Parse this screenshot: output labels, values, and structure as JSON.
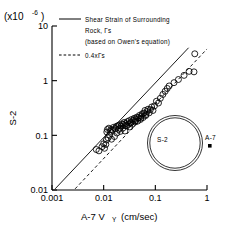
{
  "chart_data": {
    "type": "scatter",
    "title": "",
    "xlabel": "A-7 V",
    "xlabel_sub": "Y",
    "xlabel_units": "(cm/sec)",
    "ylabel": "S-2",
    "y_multiplier_note": "(x10",
    "y_multiplier_exp": "-6",
    "y_multiplier_close": ")",
    "xscale": "log",
    "yscale": "log",
    "xlim": [
      0.001,
      1
    ],
    "ylim": [
      0.01,
      10
    ],
    "xticks": [
      "0.001",
      "0.01",
      "0.1",
      "1"
    ],
    "xtick_values": [
      0.001,
      0.01,
      0.1,
      1
    ],
    "yticks": [
      "10",
      "1",
      "0.1",
      "0.01"
    ],
    "ytick_values": [
      10,
      1,
      0.1,
      0.01
    ],
    "grid": false,
    "legend_position": "top-center",
    "series": [
      {
        "name": "S-2 data",
        "marker": "open-circle",
        "points": [
          [
            0.0072,
            0.055
          ],
          [
            0.0081,
            0.052
          ],
          [
            0.0093,
            0.062
          ],
          [
            0.01,
            0.07
          ],
          [
            0.0104,
            0.058
          ],
          [
            0.011,
            0.068
          ],
          [
            0.0113,
            0.082
          ],
          [
            0.0118,
            0.128
          ],
          [
            0.0122,
            0.09
          ],
          [
            0.0126,
            0.135
          ],
          [
            0.013,
            0.1
          ],
          [
            0.0138,
            0.128
          ],
          [
            0.0142,
            0.085
          ],
          [
            0.015,
            0.125
          ],
          [
            0.0155,
            0.14
          ],
          [
            0.0162,
            0.095
          ],
          [
            0.0168,
            0.132
          ],
          [
            0.0175,
            0.145
          ],
          [
            0.018,
            0.11
          ],
          [
            0.0188,
            0.15
          ],
          [
            0.0195,
            0.128
          ],
          [
            0.0202,
            0.155
          ],
          [
            0.021,
            0.118
          ],
          [
            0.0218,
            0.148
          ],
          [
            0.0225,
            0.162
          ],
          [
            0.0235,
            0.135
          ],
          [
            0.0242,
            0.158
          ],
          [
            0.025,
            0.172
          ],
          [
            0.0258,
            0.12
          ],
          [
            0.0268,
            0.165
          ],
          [
            0.0278,
            0.148
          ],
          [
            0.0288,
            0.178
          ],
          [
            0.03,
            0.158
          ],
          [
            0.0312,
            0.185
          ],
          [
            0.0322,
            0.142
          ],
          [
            0.0335,
            0.17
          ],
          [
            0.0348,
            0.195
          ],
          [
            0.036,
            0.16
          ],
          [
            0.0375,
            0.188
          ],
          [
            0.039,
            0.205
          ],
          [
            0.0405,
            0.175
          ],
          [
            0.042,
            0.198
          ],
          [
            0.0438,
            0.215
          ],
          [
            0.0455,
            0.182
          ],
          [
            0.0475,
            0.21
          ],
          [
            0.0495,
            0.232
          ],
          [
            0.0515,
            0.195
          ],
          [
            0.0535,
            0.225
          ],
          [
            0.0558,
            0.248
          ],
          [
            0.058,
            0.212
          ],
          [
            0.0605,
            0.255
          ],
          [
            0.063,
            0.285
          ],
          [
            0.066,
            0.24
          ],
          [
            0.069,
            0.272
          ],
          [
            0.072,
            0.3
          ],
          [
            0.076,
            0.258
          ],
          [
            0.08,
            0.295
          ],
          [
            0.085,
            0.33
          ],
          [
            0.09,
            0.285
          ],
          [
            0.096,
            0.345
          ],
          [
            0.105,
            0.42
          ],
          [
            0.115,
            0.39
          ],
          [
            0.125,
            0.475
          ],
          [
            0.14,
            0.56
          ],
          [
            0.155,
            0.64
          ],
          [
            0.17,
            0.72
          ],
          [
            0.185,
            0.8
          ],
          [
            0.23,
            0.92
          ],
          [
            0.28,
            1.05
          ],
          [
            0.36,
            1.25
          ],
          [
            0.45,
            1.48
          ],
          [
            0.56,
            1.45
          ],
          [
            0.58,
            3.1
          ],
          [
            0.0115,
            0.115
          ],
          [
            0.0135,
            0.118
          ],
          [
            0.0205,
            0.135
          ],
          [
            0.0265,
            0.152
          ],
          [
            0.033,
            0.168
          ],
          [
            0.041,
            0.185
          ],
          [
            0.052,
            0.205
          ],
          [
            0.065,
            0.23
          ]
        ]
      }
    ],
    "reference_lines": [
      {
        "name": "Shear Strain of Surrounding Rock",
        "style": "solid",
        "x_start": 0.00115,
        "y_start": 0.0105,
        "x_end": 0.44,
        "y_end": 4.0
      },
      {
        "name": "0.4 x Fs",
        "style": "dashed",
        "x_start": 0.0028,
        "y_start": 0.0105,
        "x_end": 1.0,
        "y_end": 3.8
      }
    ],
    "legend_entries": [
      {
        "style": "solid",
        "line1": "Shear Strain of Surrounding",
        "line2": "Rock, Γs",
        "line3": "(based on Owen's equation)"
      },
      {
        "style": "dashed",
        "line1": "0.4xΓs"
      }
    ],
    "marker_legend": [
      {
        "label": "S-2",
        "symbol": "double-circle"
      },
      {
        "label": "A-7",
        "symbol": "filled-square"
      }
    ],
    "annotations": []
  },
  "colors": {
    "ink": "#000000",
    "background": "#ffffff"
  }
}
